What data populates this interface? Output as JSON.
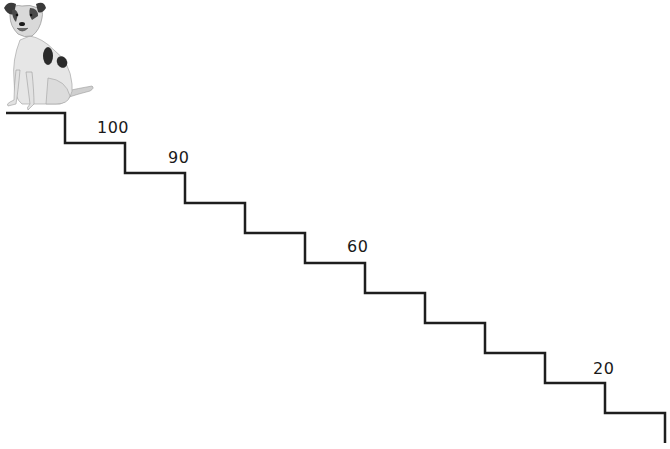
{
  "diagram": {
    "type": "staircase",
    "line_color": "#1e1e1e",
    "line_width": 2.5,
    "start": [
      6,
      113
    ],
    "step_width": 60,
    "step_height": 30,
    "step_count": 11,
    "labels": [
      {
        "text": "100",
        "x": 97,
        "y": 118
      },
      {
        "text": "90",
        "x": 168,
        "y": 148
      },
      {
        "text": "60",
        "x": 347,
        "y": 237
      },
      {
        "text": "20",
        "x": 593,
        "y": 359
      }
    ],
    "figure": {
      "name": "dog",
      "description": "Jack Russell terrier sitting"
    }
  }
}
